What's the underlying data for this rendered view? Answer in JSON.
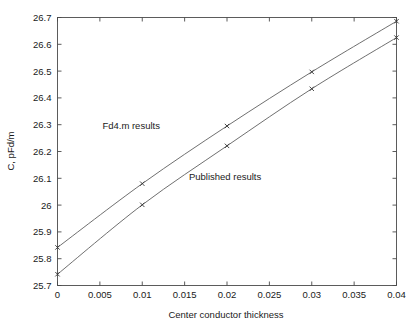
{
  "chart_data": {
    "type": "line",
    "title": "",
    "xlabel": "Center conductor thickness",
    "ylabel": "C, pFd/m",
    "xlim": [
      0,
      0.04
    ],
    "ylim": [
      25.7,
      26.7
    ],
    "grid": false,
    "legend_position": "inline-annotation",
    "xticks": [
      0,
      0.005,
      0.01,
      0.015,
      0.02,
      0.025,
      0.03,
      0.035,
      0.04
    ],
    "xtick_labels": [
      "0",
      "0.005",
      "0.01",
      "0.015",
      "0.02",
      "0.025",
      "0.03",
      "0.035",
      "0.04"
    ],
    "yticks": [
      25.7,
      25.8,
      25.9,
      26.0,
      26.1,
      26.2,
      26.3,
      26.4,
      26.5,
      26.6,
      26.7
    ],
    "ytick_labels": [
      "25.7",
      "25.8",
      "25.9",
      "26",
      "26.1",
      "26.2",
      "26.3",
      "26.4",
      "26.5",
      "26.6",
      "26.7"
    ],
    "x": [
      0,
      0.01,
      0.02,
      0.03,
      0.04
    ],
    "series": [
      {
        "name": "Fd4.m results",
        "values": [
          25.842,
          26.08,
          26.295,
          26.497,
          26.686
        ],
        "color": "#555555",
        "marker": "x",
        "annotation": "Fd4.m results",
        "annotation_x": 0.0053,
        "annotation_y": 26.285
      },
      {
        "name": "Published results",
        "values": [
          25.742,
          26.001,
          26.221,
          26.434,
          26.625
        ],
        "color": "#555555",
        "marker": "x",
        "annotation": "Published results",
        "annotation_x": 0.0155,
        "annotation_y": 26.095
      }
    ]
  },
  "axes": {
    "x_axis_label": "Center conductor thickness",
    "y_axis_label": "C, pFd/m"
  },
  "annotations": {
    "upper_label": "Fd4.m results",
    "lower_label": "Published results"
  },
  "colors": {
    "background": "#ffffff",
    "frame": "#4a4a4a",
    "line": "#555555",
    "text": "#1a1a1a"
  }
}
